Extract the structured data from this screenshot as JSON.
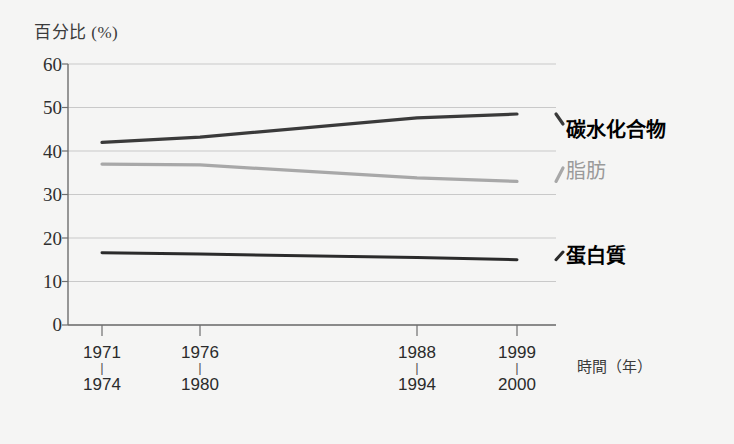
{
  "chart_data": {
    "type": "line",
    "title": "",
    "ylabel": "百分比 (%)",
    "xlabel": "時間（年）",
    "ylim": [
      0,
      60
    ],
    "yticks": [
      "0",
      "10",
      "20",
      "30",
      "40",
      "50",
      "60"
    ],
    "grid": true,
    "legend_position": "right-inline",
    "x_tick_groups": [
      {
        "top": "1971",
        "bottom": "1974",
        "dash": "|"
      },
      {
        "top": "1976",
        "bottom": "1980",
        "dash": "|"
      },
      {
        "top": "1988",
        "bottom": "1994",
        "dash": "|"
      },
      {
        "top": "1999",
        "bottom": "2000",
        "dash": "|"
      }
    ],
    "categories": [
      "1971-1974",
      "1976-1980",
      "1988-1994",
      "1999-2000"
    ],
    "series": [
      {
        "name": "碳水化合物",
        "color": "#3a3a3a",
        "values": [
          42.0,
          43.2,
          47.6,
          48.5
        ]
      },
      {
        "name": "脂肪",
        "color": "#a8a8a8",
        "values": [
          37.0,
          36.8,
          33.8,
          33.0
        ]
      },
      {
        "name": "蛋白質",
        "color": "#2b2b2b",
        "values": [
          16.6,
          16.3,
          15.5,
          15.0
        ]
      }
    ]
  },
  "colors": {
    "background": "#f5f5f4",
    "axis": "#6e6e6e",
    "grid": "#c9c9c9",
    "carbohydrate": "#3a3a3a",
    "fat": "#a8a8a8",
    "protein": "#2b2b2b",
    "text": "#2f2f2f"
  }
}
